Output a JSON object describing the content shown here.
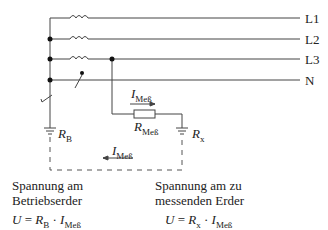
{
  "lines": [
    {
      "id": "L1",
      "label": "L1"
    },
    {
      "id": "L2",
      "label": "L2"
    },
    {
      "id": "L3",
      "label": "L3"
    },
    {
      "id": "N",
      "label": "N"
    }
  ],
  "resistors": {
    "measurement": {
      "symbol": "R",
      "subscript": "Meß"
    },
    "operating_earth": {
      "symbol": "R",
      "subscript": "B"
    },
    "earth_under_test": {
      "symbol": "R",
      "subscript": "x"
    }
  },
  "currents": {
    "upper": {
      "symbol": "I",
      "subscript": "Meß"
    },
    "lower": {
      "symbol": "I",
      "subscript": "Meß"
    }
  },
  "left_caption": {
    "line1": "Spannung am",
    "line2": "Betriebserder",
    "formula": {
      "lhs": "U",
      "eq": "=",
      "r": "R",
      "r_sub": "B",
      "dot": "·",
      "i": "I",
      "i_sub": "Meß"
    }
  },
  "right_caption": {
    "line1": "Spannung am zu",
    "line2": "messenden Erder",
    "formula": {
      "lhs": "U",
      "eq": "=",
      "r": "R",
      "r_sub": "x",
      "dot": "·",
      "i": "I",
      "i_sub": "Meß"
    }
  }
}
